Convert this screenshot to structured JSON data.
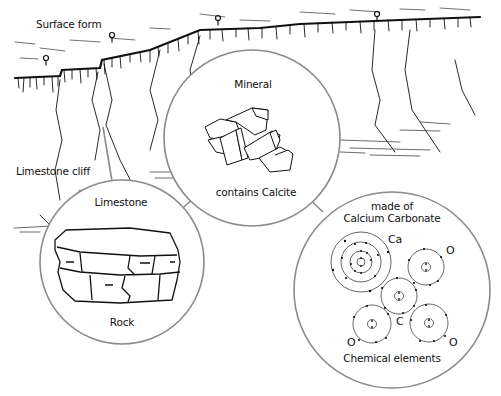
{
  "diagram": {
    "title_labels": {
      "surface_form": "Surface form",
      "limestone_cliff": "Limestone cliff"
    },
    "circles": {
      "mineral": {
        "top_label": "Mineral",
        "bottom_label": "contains Calcite",
        "icon": "crystal-cluster"
      },
      "limestone": {
        "top_label": "Limestone",
        "bottom_label": "Rock",
        "icon": "rock-block"
      },
      "chemical": {
        "top_label_line1": "made of",
        "top_label_line2": "Calcium Carbonate",
        "bottom_label": "Chemical elements",
        "atoms": [
          {
            "symbol": "Ca"
          },
          {
            "symbol": "O"
          },
          {
            "symbol": "C"
          },
          {
            "symbol": "O"
          },
          {
            "symbol": "O"
          }
        ]
      }
    },
    "colors": {
      "circle_stroke": "#8a8a8a",
      "ink": "#111111"
    }
  }
}
